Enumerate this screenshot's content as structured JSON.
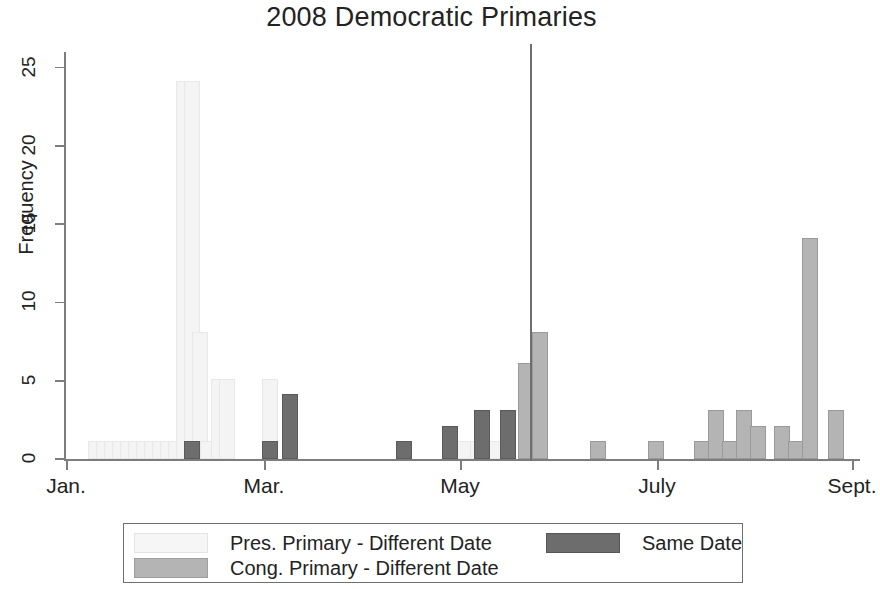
{
  "chart_data": {
    "type": "bar",
    "title": "2008 Democratic Primaries",
    "xlabel": "",
    "ylabel": "Frequency",
    "ylim": [
      0,
      26
    ],
    "ytick_labels": [
      "0",
      "5",
      "10",
      "15",
      "20",
      "25"
    ],
    "ytick_values": [
      0,
      5,
      10,
      15,
      20,
      25
    ],
    "xtick_labels": [
      "Jan.",
      "Mar.",
      "May",
      "July",
      "Sept."
    ],
    "grid": false,
    "legend_position": "below-plot",
    "annotations": [
      {
        "name": "vertical-reference-line",
        "kind": "vline",
        "x_label": "early June"
      }
    ],
    "series": [
      {
        "name": "Pres. Primary - Different Date",
        "color": "#f4f4f4",
        "bars": [
          {
            "x": 22,
            "value": 1
          },
          {
            "x": 30,
            "value": 1
          },
          {
            "x": 38,
            "value": 1
          },
          {
            "x": 46,
            "value": 1
          },
          {
            "x": 54,
            "value": 1
          },
          {
            "x": 62,
            "value": 1
          },
          {
            "x": 70,
            "value": 1
          },
          {
            "x": 78,
            "value": 1
          },
          {
            "x": 86,
            "value": 1
          },
          {
            "x": 94,
            "value": 1
          },
          {
            "x": 102,
            "value": 1
          },
          {
            "x": 110,
            "value": 24
          },
          {
            "x": 118,
            "value": 24
          },
          {
            "x": 126,
            "value": 8
          },
          {
            "x": 134,
            "value": 1
          },
          {
            "x": 145,
            "value": 5
          },
          {
            "x": 153,
            "value": 5
          },
          {
            "x": 196,
            "value": 5
          },
          {
            "x": 390,
            "value": 1
          },
          {
            "x": 404,
            "value": 1
          },
          {
            "x": 420,
            "value": 1
          }
        ]
      },
      {
        "name": "Cong. Primary - Different Date",
        "color": "#b4b4b4",
        "bars": [
          {
            "x": 452,
            "value": 6
          },
          {
            "x": 466,
            "value": 8
          },
          {
            "x": 524,
            "value": 1
          },
          {
            "x": 582,
            "value": 1
          },
          {
            "x": 628,
            "value": 1
          },
          {
            "x": 642,
            "value": 3
          },
          {
            "x": 656,
            "value": 1
          },
          {
            "x": 670,
            "value": 3
          },
          {
            "x": 684,
            "value": 2
          },
          {
            "x": 708,
            "value": 2
          },
          {
            "x": 722,
            "value": 1
          },
          {
            "x": 736,
            "value": 14
          },
          {
            "x": 762,
            "value": 3
          }
        ]
      },
      {
        "name": "Same Date",
        "color": "#6d6d6d",
        "bars": [
          {
            "x": 118,
            "value": 1
          },
          {
            "x": 196,
            "value": 1
          },
          {
            "x": 216,
            "value": 4
          },
          {
            "x": 330,
            "value": 1
          },
          {
            "x": 376,
            "value": 2
          },
          {
            "x": 434,
            "value": 3
          },
          {
            "x": 408,
            "value": 3
          }
        ]
      }
    ]
  },
  "legend": {
    "entries": [
      {
        "label": "Pres. Primary - Different Date",
        "swatch": "pres"
      },
      {
        "label": "Cong. Primary - Different Date",
        "swatch": "cong"
      },
      {
        "label": "Same Date",
        "swatch": "same"
      }
    ]
  },
  "axes": {
    "y_label": "Frequency",
    "y_ticks": [
      "0",
      "5",
      "10",
      "15",
      "20",
      "25"
    ],
    "x_ticks": [
      "Jan.",
      "Mar.",
      "May",
      "July",
      "Sept."
    ]
  },
  "title": "2008 Democratic Primaries"
}
